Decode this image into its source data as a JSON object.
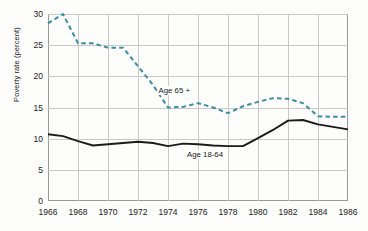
{
  "chart_data": {
    "type": "line",
    "title": "",
    "xlabel": "",
    "ylabel": "Poverty rate (percent)",
    "xlim": [
      1966,
      1986
    ],
    "ylim": [
      0,
      30
    ],
    "grid": true,
    "legend_position": "inline-annotation",
    "x": [
      1966,
      1967,
      1968,
      1969,
      1970,
      1971,
      1972,
      1973,
      1974,
      1975,
      1976,
      1977,
      1978,
      1979,
      1980,
      1981,
      1982,
      1983,
      1984,
      1985,
      1986
    ],
    "xticks": [
      1966,
      1968,
      1970,
      1972,
      1974,
      1976,
      1978,
      1980,
      1982,
      1984,
      1986
    ],
    "xtick_labels": [
      "1966",
      "1968",
      "1970",
      "1972",
      "1974",
      "1976",
      "1978",
      "1980",
      "1982",
      "1984",
      "1986"
    ],
    "yticks": [
      0,
      5,
      10,
      15,
      20,
      25,
      30
    ],
    "ytick_labels": [
      "0",
      "5",
      "10",
      "15",
      "20",
      "25",
      "30"
    ],
    "series": [
      {
        "name": "Age 65 +",
        "label": "Age 65 +",
        "style": "dashed",
        "color": "#3d8ca5",
        "values": [
          28.5,
          30.0,
          25.3,
          25.3,
          24.6,
          24.6,
          21.6,
          18.6,
          15.0,
          15.1,
          15.7,
          15.0,
          14.1,
          15.2,
          15.9,
          16.5,
          16.4,
          15.7,
          13.6,
          13.5,
          13.5
        ]
      },
      {
        "name": "Age 18-64",
        "label": "Age 18-64",
        "style": "solid",
        "color": "#1b1b1b",
        "values": [
          10.7,
          10.4,
          9.6,
          8.9,
          9.1,
          9.3,
          9.5,
          9.3,
          8.8,
          9.2,
          9.1,
          8.9,
          8.8,
          8.8,
          10.1,
          11.4,
          12.9,
          13.0,
          12.3,
          11.9,
          11.5
        ]
      }
    ],
    "annotations": [
      {
        "text": "Age 65 +",
        "x": 1973.3,
        "y": 17.6
      },
      {
        "text": "Age 18-64",
        "x": 1975.2,
        "y": 7.3
      }
    ]
  },
  "axes": {
    "y_title": "Poverty rate (percent)"
  }
}
